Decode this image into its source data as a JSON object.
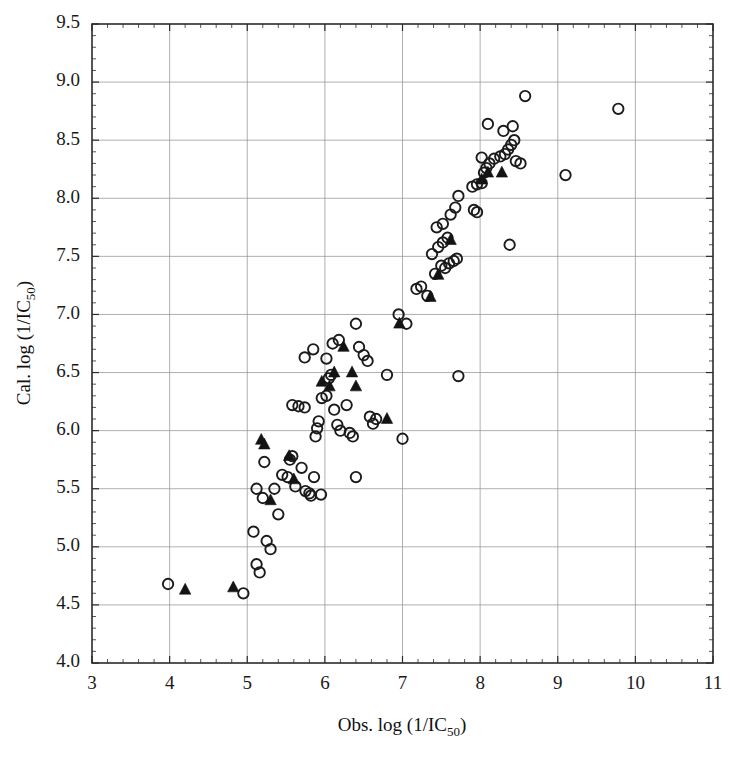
{
  "figure": {
    "background": "#ffffff",
    "foreground": "#1a1a1a"
  },
  "axes": {
    "x_title_main": "Obs. log (1/IC",
    "x_title_sub": "50",
    "x_title_end": ")",
    "y_title_main": "Cal. log (1/IC",
    "y_title_sub": "50",
    "y_title_end": ")",
    "x_ticks": [
      "3",
      "4",
      "5",
      "6",
      "7",
      "8",
      "9",
      "10",
      "11"
    ],
    "y_ticks": [
      "4.0",
      "4.5",
      "5.0",
      "5.5",
      "6.0",
      "6.5",
      "7.0",
      "7.5",
      "8.0",
      "8.5",
      "9.0",
      "9.5"
    ]
  },
  "chart_data": {
    "type": "scatter",
    "title": "",
    "xlabel": "Obs. log (1/IC50)",
    "ylabel": "Cal. log (1/IC50)",
    "xlim": [
      3,
      11
    ],
    "ylim": [
      4.0,
      9.5
    ],
    "xtick_step": 1,
    "ytick_step": 0.5,
    "grid": true,
    "legend": "none",
    "series": [
      {
        "name": "training set",
        "marker": "open-circle",
        "color": "#1b1b1b",
        "points": [
          [
            3.98,
            4.68
          ],
          [
            4.95,
            4.6
          ],
          [
            5.08,
            5.13
          ],
          [
            5.12,
            4.85
          ],
          [
            5.16,
            4.78
          ],
          [
            5.2,
            5.42
          ],
          [
            5.12,
            5.5
          ],
          [
            5.25,
            5.05
          ],
          [
            5.22,
            5.73
          ],
          [
            5.3,
            4.98
          ],
          [
            5.35,
            5.5
          ],
          [
            5.4,
            5.28
          ],
          [
            5.45,
            5.62
          ],
          [
            5.52,
            5.6
          ],
          [
            5.55,
            5.75
          ],
          [
            5.58,
            5.78
          ],
          [
            5.62,
            5.52
          ],
          [
            5.7,
            5.68
          ],
          [
            5.75,
            5.48
          ],
          [
            5.8,
            5.46
          ],
          [
            5.82,
            5.44
          ],
          [
            5.86,
            5.6
          ],
          [
            5.88,
            5.95
          ],
          [
            5.9,
            6.02
          ],
          [
            5.92,
            6.08
          ],
          [
            5.95,
            5.45
          ],
          [
            5.58,
            6.22
          ],
          [
            5.66,
            6.21
          ],
          [
            5.74,
            6.2
          ],
          [
            5.96,
            6.28
          ],
          [
            6.02,
            6.3
          ],
          [
            6.05,
            6.45
          ],
          [
            6.08,
            6.48
          ],
          [
            6.12,
            6.18
          ],
          [
            6.16,
            6.05
          ],
          [
            6.2,
            6.0
          ],
          [
            6.02,
            6.62
          ],
          [
            6.1,
            6.75
          ],
          [
            6.18,
            6.78
          ],
          [
            5.85,
            6.7
          ],
          [
            5.74,
            6.63
          ],
          [
            6.4,
            6.92
          ],
          [
            6.28,
            6.22
          ],
          [
            6.32,
            5.98
          ],
          [
            6.36,
            5.95
          ],
          [
            6.44,
            6.72
          ],
          [
            6.5,
            6.65
          ],
          [
            6.55,
            6.6
          ],
          [
            6.58,
            6.12
          ],
          [
            6.66,
            6.1
          ],
          [
            6.62,
            6.06
          ],
          [
            6.4,
            5.6
          ],
          [
            6.8,
            6.48
          ],
          [
            6.95,
            7.0
          ],
          [
            7.0,
            5.93
          ],
          [
            7.05,
            6.92
          ],
          [
            7.72,
            6.47
          ],
          [
            7.18,
            7.22
          ],
          [
            7.24,
            7.24
          ],
          [
            7.32,
            7.16
          ],
          [
            7.42,
            7.35
          ],
          [
            7.5,
            7.42
          ],
          [
            7.55,
            7.4
          ],
          [
            7.6,
            7.44
          ],
          [
            7.66,
            7.46
          ],
          [
            7.7,
            7.48
          ],
          [
            7.38,
            7.52
          ],
          [
            7.46,
            7.58
          ],
          [
            7.52,
            7.62
          ],
          [
            7.58,
            7.66
          ],
          [
            7.44,
            7.75
          ],
          [
            7.52,
            7.78
          ],
          [
            7.62,
            7.86
          ],
          [
            7.68,
            7.92
          ],
          [
            7.92,
            7.9
          ],
          [
            7.96,
            7.88
          ],
          [
            8.38,
            7.6
          ],
          [
            7.72,
            8.02
          ],
          [
            7.9,
            8.1
          ],
          [
            7.96,
            8.12
          ],
          [
            8.02,
            8.13
          ],
          [
            8.05,
            8.22
          ],
          [
            8.08,
            8.26
          ],
          [
            8.12,
            8.3
          ],
          [
            8.18,
            8.34
          ],
          [
            8.02,
            8.35
          ],
          [
            8.26,
            8.36
          ],
          [
            8.32,
            8.38
          ],
          [
            8.36,
            8.42
          ],
          [
            8.4,
            8.46
          ],
          [
            8.44,
            8.5
          ],
          [
            8.1,
            8.64
          ],
          [
            8.3,
            8.58
          ],
          [
            8.42,
            8.62
          ],
          [
            8.46,
            8.32
          ],
          [
            8.52,
            8.3
          ],
          [
            8.58,
            8.88
          ],
          [
            9.1,
            8.2
          ],
          [
            9.78,
            8.77
          ]
        ]
      },
      {
        "name": "test set",
        "marker": "filled-triangle",
        "color": "#131313",
        "points": [
          [
            4.2,
            4.63
          ],
          [
            4.82,
            4.65
          ],
          [
            5.18,
            5.92
          ],
          [
            5.22,
            5.88
          ],
          [
            5.3,
            5.4
          ],
          [
            5.54,
            5.78
          ],
          [
            5.6,
            5.58
          ],
          [
            5.96,
            6.42
          ],
          [
            6.06,
            6.38
          ],
          [
            6.12,
            6.5
          ],
          [
            6.24,
            6.72
          ],
          [
            6.35,
            6.5
          ],
          [
            6.4,
            6.38
          ],
          [
            6.8,
            6.1
          ],
          [
            6.96,
            6.92
          ],
          [
            7.36,
            7.15
          ],
          [
            7.46,
            7.34
          ],
          [
            7.62,
            7.64
          ],
          [
            8.02,
            8.16
          ],
          [
            8.1,
            8.22
          ],
          [
            8.28,
            8.22
          ]
        ]
      }
    ]
  }
}
